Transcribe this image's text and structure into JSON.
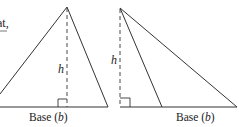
{
  "caption_fragment": "at,",
  "figures": [
    {
      "name": "acute-triangle",
      "height_label": "h",
      "base_label": "Base (",
      "base_var": "b",
      "base_close": ")"
    },
    {
      "name": "obtuse-triangle",
      "height_label": "h",
      "base_label": "Base (",
      "base_var": "b",
      "base_close": ")"
    }
  ],
  "colors": {
    "stroke": "#333333",
    "text": "#222222"
  }
}
